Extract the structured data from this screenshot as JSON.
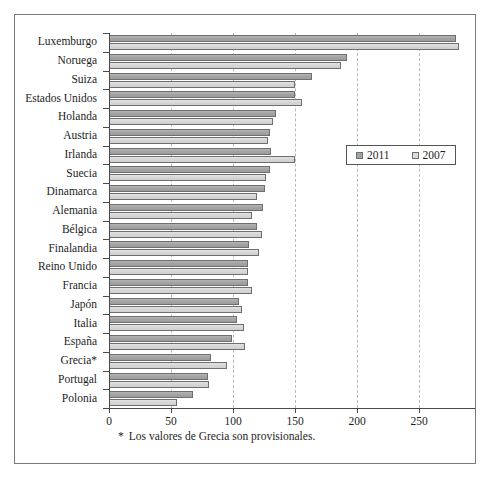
{
  "chart_data": {
    "type": "bar",
    "orientation": "horizontal",
    "title": "",
    "subtitle": "",
    "xlabel": "",
    "ylabel": "",
    "xlim": [
      0,
      280
    ],
    "xticks": [
      0,
      50,
      100,
      150,
      200,
      250
    ],
    "xtick_labels": [
      "0",
      "50",
      "100",
      "150",
      "200",
      "250"
    ],
    "grid": true,
    "grid_axis": "x",
    "legend_position": "center-right",
    "categories": [
      "Luxemburgo",
      "Noruega",
      "Suiza",
      "Estados Unidos",
      "Holanda",
      "Austria",
      "Irlanda",
      "Suecia",
      "Dinamarca",
      "Alemania",
      "Bélgica",
      "Finalandia",
      "Reino Unido",
      "Francia",
      "Japón",
      "Italia",
      "España",
      "Grecia*",
      "Portugal",
      "Polonia"
    ],
    "series": [
      {
        "name": "2011",
        "color": "#a3a3a3",
        "values": [
          280,
          192,
          164,
          150,
          135,
          130,
          131,
          130,
          126,
          124,
          119,
          113,
          112,
          112,
          105,
          103,
          99,
          82,
          80,
          68
        ]
      },
      {
        "name": "2007",
        "color": "#dcdcdc",
        "values": [
          282,
          187,
          150,
          156,
          132,
          128,
          150,
          127,
          119,
          115,
          123,
          121,
          112,
          115,
          107,
          109,
          110,
          95,
          81,
          55
        ]
      }
    ],
    "annotations": [
      "* Los valores de Grecia son provisionales."
    ]
  },
  "legend": {
    "entries": [
      {
        "label": "2011",
        "swatch": "legend-swatch-2011"
      },
      {
        "label": "2007",
        "swatch": "legend-swatch-2007"
      }
    ]
  },
  "footnote": {
    "marker": "*",
    "text": "Los valores de Grecia son provisionales."
  }
}
